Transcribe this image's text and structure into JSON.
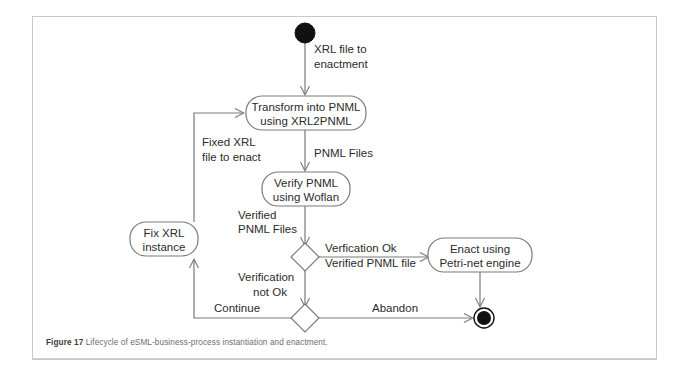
{
  "figure": {
    "caption_label": "Figure 17",
    "caption_text": "Lifecycle of eSML-business-process instantiation and enactment.",
    "frame_color": "#c9c9c9",
    "line_color": "#7a7a7a",
    "text_color": "#2b2b2b",
    "node_fill": "#ffffff",
    "terminal_fill": "#111111"
  },
  "diagram": {
    "type": "uml-activity-diagram",
    "title": "Lifecycle of eSML-business-process instantiation and enactment",
    "nodes": [
      {
        "id": "initial",
        "kind": "initial-node",
        "label": "",
        "x": 305,
        "y": 33,
        "r": 10
      },
      {
        "id": "transform",
        "kind": "action",
        "line1": "Transform into PNML",
        "line2": "using XRL2PNML",
        "x": 246,
        "y": 96,
        "w": 120,
        "h": 34
      },
      {
        "id": "verify",
        "kind": "action",
        "line1": "Verify PNML",
        "line2": "using Woflan",
        "x": 262,
        "y": 172,
        "w": 88,
        "h": 34
      },
      {
        "id": "decision",
        "kind": "decision-node",
        "label": "",
        "x": 306,
        "y": 257,
        "rx": 13,
        "ry": 14
      },
      {
        "id": "fix",
        "kind": "action",
        "line1": "Fix XRL",
        "line2": "instance",
        "x": 162,
        "y": 239,
        "w": 64,
        "h": 34
      },
      {
        "id": "enact",
        "kind": "action",
        "line1": "Enact using",
        "line2": "Petri-net engine",
        "x": 430,
        "y": 238,
        "w": 100,
        "h": 34
      },
      {
        "id": "merge",
        "kind": "merge-node",
        "label": "",
        "x": 306,
        "y": 318,
        "rx": 13,
        "ry": 14
      },
      {
        "id": "final",
        "kind": "final-node",
        "label": "",
        "x": 484,
        "y": 318,
        "r": 10
      }
    ],
    "edges": [
      {
        "id": "e-initial-transform",
        "from": "initial",
        "to": "transform",
        "line1": "XRL file to",
        "line2": "enactment"
      },
      {
        "id": "e-transform-verify",
        "from": "transform",
        "to": "verify",
        "line1": "PNML Files",
        "line2": ""
      },
      {
        "id": "e-verify-decision",
        "from": "verify",
        "to": "decision",
        "line1": "Verified",
        "line2": "PNML Files"
      },
      {
        "id": "e-decision-enact",
        "from": "decision",
        "to": "enact",
        "line1": "Verfication Ok",
        "line2": "Verified PNML file"
      },
      {
        "id": "e-decision-merge",
        "from": "decision",
        "to": "merge",
        "line1": "Verification",
        "line2": "not Ok"
      },
      {
        "id": "e-merge-fix",
        "from": "merge",
        "to": "fix",
        "line1": "Continue",
        "line2": ""
      },
      {
        "id": "e-merge-final",
        "from": "merge",
        "to": "final",
        "line1": "Abandon",
        "line2": ""
      },
      {
        "id": "e-fix-transform",
        "from": "fix",
        "to": "transform",
        "line1": "Fixed XRL",
        "line2": "file to enact"
      },
      {
        "id": "e-enact-final",
        "from": "enact",
        "to": "final",
        "line1": "",
        "line2": ""
      }
    ]
  },
  "labels": {
    "initial_to_transform_1": "XRL file to",
    "initial_to_transform_2": "enactment",
    "transform_1": "Transform into PNML",
    "transform_2": "using XRL2PNML",
    "pnml_files": "PNML Files",
    "verify_1": "Verify PNML",
    "verify_2": "using Woflan",
    "verified_1": "Verified",
    "verified_2": "PNML Files",
    "fixed_1": "Fixed XRL",
    "fixed_2": "file to enact",
    "fix_1": "Fix XRL",
    "fix_2": "instance",
    "verfication_ok": "Verfication Ok",
    "verified_pnml_file": "Verified PNML file",
    "enact_1": "Enact using",
    "enact_2": "Petri-net engine",
    "verification_1": "Verification",
    "verification_2": "not Ok",
    "continue": "Continue",
    "abandon": "Abandon"
  }
}
